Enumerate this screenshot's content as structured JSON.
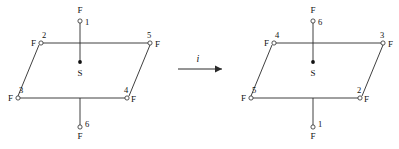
{
  "figure": {
    "type": "chemical-structure-diagram",
    "background_color": "#ffffff",
    "line_color": "#2a2a2a"
  },
  "arrow": {
    "label": "i",
    "name": "inversion-operation",
    "direction": "right"
  },
  "left_structure": {
    "name": "sf6-before-inversion",
    "center": {
      "label": "S",
      "x": 80,
      "y": 62
    },
    "axial_top": {
      "element": "F",
      "number": "1",
      "x": 80,
      "y": 20
    },
    "axial_bottom": {
      "element": "F",
      "number": "6",
      "x": 80,
      "y": 128
    },
    "equatorial": [
      {
        "element": "F",
        "number": "2",
        "x": 41,
        "y": 43,
        "label_side": "left"
      },
      {
        "element": "F",
        "number": "5",
        "x": 150,
        "y": 43,
        "label_side": "right"
      },
      {
        "element": "F",
        "number": "3",
        "x": 18,
        "y": 98,
        "label_side": "left"
      },
      {
        "element": "F",
        "number": "4",
        "x": 127,
        "y": 98,
        "label_side": "right"
      }
    ]
  },
  "right_structure": {
    "name": "sf6-after-inversion",
    "center": {
      "label": "S",
      "x": 313,
      "y": 62
    },
    "axial_top": {
      "element": "F",
      "number": "6",
      "x": 313,
      "y": 20
    },
    "axial_bottom": {
      "element": "F",
      "number": "1",
      "x": 313,
      "y": 128
    },
    "equatorial": [
      {
        "element": "F",
        "number": "4",
        "x": 274,
        "y": 43,
        "label_side": "left"
      },
      {
        "element": "F",
        "number": "3",
        "x": 383,
        "y": 43,
        "label_side": "right"
      },
      {
        "element": "F",
        "number": "5",
        "x": 251,
        "y": 98,
        "label_side": "left"
      },
      {
        "element": "F",
        "number": "2",
        "x": 360,
        "y": 98,
        "label_side": "right"
      }
    ]
  }
}
